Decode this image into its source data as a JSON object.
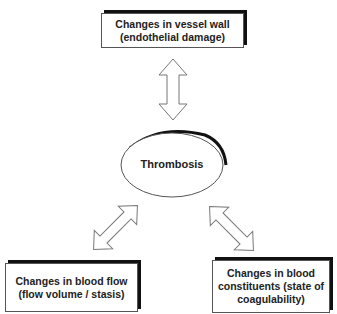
{
  "diagram": {
    "center": {
      "label": "Thrombosis"
    },
    "nodes": [
      {
        "id": "vessel-wall",
        "lines": [
          "Changes in vessel wall",
          "(endothelial damage)"
        ]
      },
      {
        "id": "blood-flow",
        "lines": [
          "Changes in blood flow",
          "(flow volume / stasis)"
        ]
      },
      {
        "id": "blood-constituents",
        "lines": [
          "Changes in blood",
          "constituents (state of",
          "coagulability)"
        ]
      }
    ],
    "edges": [
      {
        "from": "vessel-wall",
        "to": "center",
        "type": "double-arrow"
      },
      {
        "from": "blood-flow",
        "to": "center",
        "type": "double-arrow"
      },
      {
        "from": "blood-constituents",
        "to": "center",
        "type": "double-arrow"
      }
    ]
  }
}
